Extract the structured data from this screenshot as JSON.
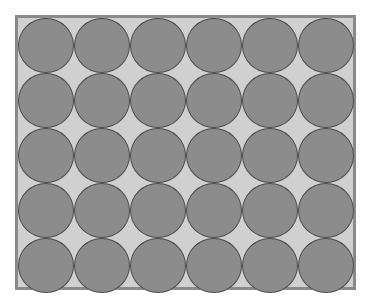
{
  "diagram": {
    "type": "circle-packing-grid",
    "rows": 5,
    "columns": 6,
    "circle_count": 30,
    "colors": {
      "frame_border": "#8a8a8a",
      "background": "#d0d0d0",
      "circle_fill": "#8c8c8c",
      "circle_outline": "#4a4a4a"
    }
  }
}
